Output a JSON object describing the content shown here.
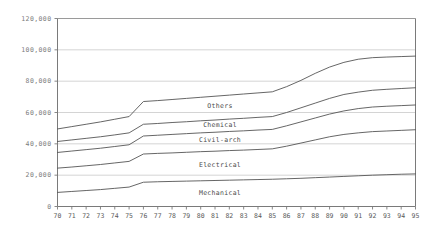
{
  "chart_data": {
    "type": "line",
    "title": "",
    "subtitle": "",
    "xlabel": "",
    "ylabel": "",
    "grid": true,
    "legend_position": "inline-band-labels",
    "xlim": [
      70,
      95
    ],
    "ylim": [
      0,
      120000
    ],
    "ytick_labels": [
      "0",
      "20,000",
      "40,000",
      "60,000",
      "80,000",
      "100,000",
      "120,000"
    ],
    "ytick_values": [
      0,
      20000,
      40000,
      60000,
      80000,
      100000,
      120000
    ],
    "x": [
      70,
      71,
      72,
      73,
      74,
      75,
      76,
      77,
      78,
      79,
      80,
      81,
      82,
      83,
      84,
      85,
      86,
      87,
      88,
      89,
      90,
      91,
      92,
      93,
      94,
      95
    ],
    "xtick_labels": [
      "70",
      "71",
      "72",
      "73",
      "74",
      "75",
      "76",
      "77",
      "78",
      "79",
      "80",
      "81",
      "82",
      "83",
      "84",
      "85",
      "86",
      "87",
      "88",
      "89",
      "90",
      "91",
      "92",
      "93",
      "94",
      "95"
    ],
    "note": "Cumulative (stacked) boundary lines; each series value below is the cumulative total at that boundary.",
    "series": [
      {
        "name": "Mechanical",
        "label": "Mechanical",
        "cumulative": [
          9000,
          9600,
          10200,
          10800,
          11600,
          12400,
          15500,
          15800,
          16000,
          16200,
          16400,
          16600,
          16800,
          17000,
          17200,
          17400,
          17700,
          18000,
          18400,
          18800,
          19200,
          19600,
          20000,
          20300,
          20600,
          20800
        ]
      },
      {
        "name": "Electrical",
        "label": "Electrical",
        "cumulative": [
          24500,
          25200,
          26000,
          26800,
          27800,
          28800,
          33500,
          33900,
          34200,
          34600,
          35000,
          35300,
          35700,
          36000,
          36400,
          36800,
          38500,
          40500,
          42500,
          44500,
          46000,
          47000,
          47800,
          48200,
          48600,
          49000
        ]
      },
      {
        "name": "Civil-arch",
        "label": "Civil-arch",
        "cumulative": [
          34500,
          35400,
          36300,
          37200,
          38300,
          39400,
          45000,
          45500,
          46000,
          46500,
          47000,
          47400,
          47900,
          48300,
          48800,
          49200,
          51500,
          54000,
          56500,
          59000,
          61000,
          62500,
          63500,
          64000,
          64400,
          64800
        ]
      },
      {
        "name": "Chemical",
        "label": "Chemical",
        "cumulative": [
          41500,
          42500,
          43500,
          44500,
          45700,
          47000,
          52500,
          53000,
          53600,
          54100,
          54700,
          55200,
          55800,
          56300,
          56900,
          57400,
          60000,
          63000,
          66000,
          69000,
          71500,
          73000,
          74200,
          74800,
          75300,
          75800
        ]
      },
      {
        "name": "Others",
        "label": "Others",
        "cumulative": [
          49500,
          51000,
          52500,
          54000,
          55700,
          57400,
          67000,
          67600,
          68300,
          69000,
          69700,
          70400,
          71100,
          71800,
          72500,
          73200,
          76500,
          80500,
          85000,
          89000,
          92000,
          94000,
          95000,
          95400,
          95700,
          96000
        ]
      }
    ]
  }
}
